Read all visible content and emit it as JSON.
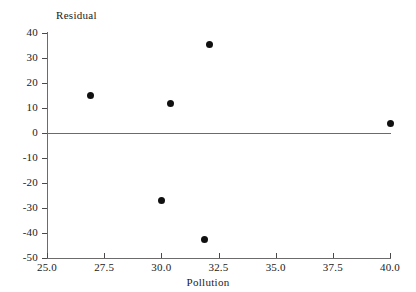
{
  "chart_data": {
    "type": "scatter",
    "title": "",
    "xlabel": "Pollution",
    "ylabel": "Residual",
    "xlim": [
      25.0,
      40.0
    ],
    "ylim": [
      -50,
      40
    ],
    "xticks": [
      "25.0",
      "27.5",
      "30.0",
      "32.5",
      "35.0",
      "37.5",
      "40.0"
    ],
    "xtick_values": [
      25.0,
      27.5,
      30.0,
      32.5,
      35.0,
      37.5,
      40.0
    ],
    "yticks": [
      "40",
      "30",
      "20",
      "10",
      "0",
      "-10",
      "-20",
      "-30",
      "-40",
      "-50"
    ],
    "ytick_values": [
      40,
      30,
      20,
      10,
      0,
      -10,
      -20,
      -30,
      -40,
      -50
    ],
    "grid": false,
    "legend": null,
    "reference_line": {
      "y": 0,
      "style": "solid",
      "color": "#6b6b6b"
    },
    "marker": {
      "shape": "circle",
      "filled": true,
      "color": "#101010",
      "size": 7
    },
    "points": [
      {
        "x": 26.9,
        "y": 15.0
      },
      {
        "x": 30.4,
        "y": 12.0
      },
      {
        "x": 32.1,
        "y": 35.5
      },
      {
        "x": 30.0,
        "y": -27.0
      },
      {
        "x": 31.9,
        "y": -42.5
      },
      {
        "x": 40.0,
        "y": 4.0
      }
    ]
  }
}
